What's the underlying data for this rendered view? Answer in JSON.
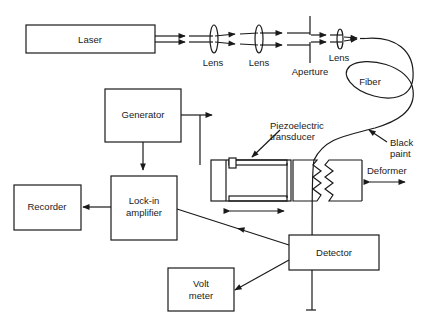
{
  "diagram": {
    "type": "optical fiber sensor experimental setup",
    "components": {
      "laser": "Laser",
      "lens1": "Lens",
      "lens2": "Lens",
      "aperture": "Aperture",
      "lens3": "Lens",
      "fiber": "Fiber",
      "black_paint": [
        "Black",
        "paint"
      ],
      "generator": "Generator",
      "piezo": [
        "Piezoelectric",
        "transducer"
      ],
      "deformer": "Deformer",
      "lockin": [
        "Lock-in",
        "amplifier"
      ],
      "recorder": "Recorder",
      "detector": "Detector",
      "voltmeter": [
        "Volt",
        "meter"
      ]
    },
    "connections": [
      {
        "from": "Laser",
        "to": "Lens",
        "type": "beam"
      },
      {
        "from": "Lens",
        "to": "Lens",
        "type": "beam"
      },
      {
        "from": "Lens",
        "to": "Aperture",
        "type": "beam"
      },
      {
        "from": "Aperture",
        "to": "Lens",
        "type": "beam"
      },
      {
        "from": "Lens",
        "to": "Fiber",
        "type": "beam"
      },
      {
        "from": "Generator",
        "to": "Piezoelectric transducer",
        "type": "signal"
      },
      {
        "from": "Generator",
        "to": "Lock-in amplifier",
        "type": "signal"
      },
      {
        "from": "Detector",
        "to": "Lock-in amplifier",
        "type": "signal"
      },
      {
        "from": "Lock-in amplifier",
        "to": "Recorder",
        "type": "signal"
      },
      {
        "from": "Detector",
        "to": "Volt meter",
        "type": "signal"
      },
      {
        "from": "Fiber",
        "to": "Detector",
        "type": "fiber"
      }
    ]
  }
}
